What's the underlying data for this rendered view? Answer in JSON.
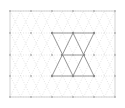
{
  "figure": {
    "type": "diagram",
    "width": 125,
    "height": 108,
    "background_color": "#ffffff"
  },
  "frame": {
    "x": 10,
    "y": 11,
    "width": 105,
    "height": 86,
    "stroke_color": "#c8c8c8",
    "stroke_width": 0.8
  },
  "colors": {
    "lattice_line": "#d9d9d9",
    "lattice_line_faint": "#e4e4e4",
    "highlight_line": "#9a9a9a",
    "vertex_dot": "#b0b0b0",
    "highlight_vertex_dot": "#8a8a8a",
    "frame": "#c8c8c8"
  },
  "lattice": {
    "kind": "triangular",
    "row_spacing": 21.5,
    "column_spacing": 21.0,
    "row_y_positions": [
      11,
      33,
      55,
      76,
      97
    ],
    "horizontal_line_dash": "1,1.6",
    "diagonal_line_dash": "1,1.6",
    "horizontal_lines": [
      {
        "y": 11,
        "x1": 10,
        "x2": 115,
        "style": "solid-faint"
      },
      {
        "y": 33,
        "x1": 10,
        "x2": 115,
        "style": "dotted"
      },
      {
        "y": 55,
        "x1": 10,
        "x2": 115,
        "style": "dotted"
      },
      {
        "y": 76,
        "x1": 10,
        "x2": 115,
        "style": "dotted"
      },
      {
        "y": 97,
        "x1": 10,
        "x2": 115,
        "style": "solid-faint"
      }
    ],
    "vertex_rows": [
      {
        "y": 11,
        "x_values": [
          10,
          31,
          52,
          73,
          94,
          115
        ],
        "offset": "aligned"
      },
      {
        "y": 33,
        "x_values": [
          10,
          31,
          52,
          73,
          94,
          115
        ],
        "offset": "aligned"
      },
      {
        "y": 55,
        "x_values": [
          10,
          31,
          52,
          73,
          94,
          115
        ],
        "offset": "aligned"
      },
      {
        "y": 76,
        "x_values": [
          10,
          31,
          52,
          73,
          94,
          115
        ],
        "offset": "aligned"
      },
      {
        "y": 97,
        "x_values": [
          10,
          31,
          52,
          73,
          94,
          115
        ],
        "offset": "aligned"
      }
    ]
  },
  "highlight": {
    "name": "hexagram",
    "description": "Star of David formed by two overlapping equilateral triangles spanning rows y=33 to y=76",
    "stroke_color": "#9a9a9a",
    "stroke_width": 1.0,
    "triangle_up": {
      "points": "52,76 94,76 73,33"
    },
    "triangle_down": {
      "points": "52,33 94,33 73,76"
    },
    "inner_chord": {
      "x1": 62,
      "y1": 55,
      "x2": 84,
      "y2": 55
    },
    "highlight_vertices": [
      {
        "x": 52,
        "y": 33
      },
      {
        "x": 73,
        "y": 33
      },
      {
        "x": 94,
        "y": 33
      },
      {
        "x": 62,
        "y": 55
      },
      {
        "x": 84,
        "y": 55
      },
      {
        "x": 52,
        "y": 76
      },
      {
        "x": 73,
        "y": 76
      },
      {
        "x": 94,
        "y": 76
      }
    ]
  }
}
